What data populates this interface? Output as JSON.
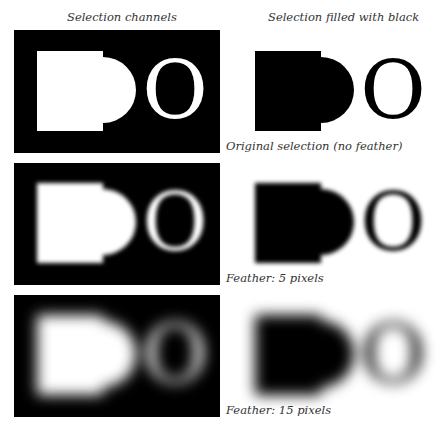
{
  "figure": {
    "column_headers": {
      "left": "Selection channels",
      "right": "Selection filled with black"
    },
    "rows": [
      {
        "caption": "Original selection (no feather)",
        "feather_px": 0
      },
      {
        "caption": "Feather: 5 pixels",
        "feather_px": 5
      },
      {
        "caption": "Feather: 15 pixels",
        "feather_px": 15
      }
    ],
    "shape_glyph": "O",
    "colors": {
      "channel_background": "#000000",
      "channel_selection": "#ffffff",
      "fill_color": "#000000",
      "page_background": "#ffffff",
      "caption_text": "#333333"
    }
  }
}
